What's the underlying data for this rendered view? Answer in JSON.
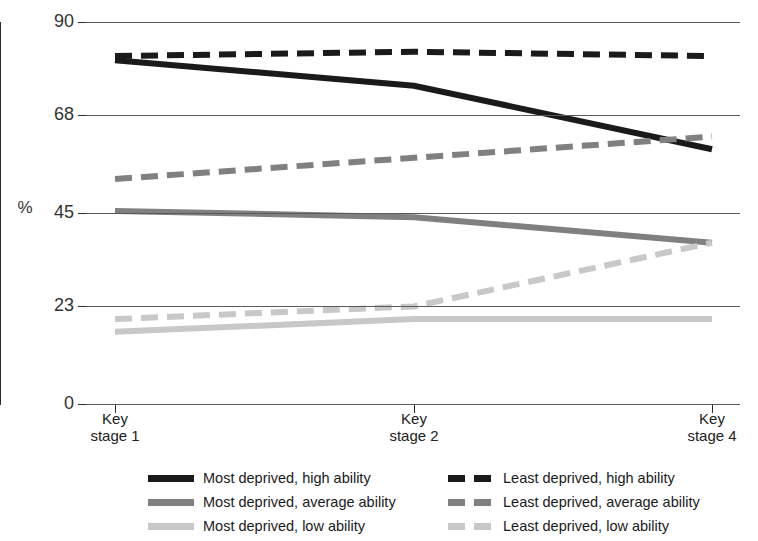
{
  "chart_data": {
    "type": "line",
    "title": "",
    "xlabel": "",
    "ylabel": "%",
    "categories": [
      "Key\nstage 1",
      "Key\nstage 2",
      "Key\nstage 4"
    ],
    "category_labels": [
      {
        "line1": "Key",
        "line2": "stage 1"
      },
      {
        "line1": "Key",
        "line2": "stage 2"
      },
      {
        "line1": "Key",
        "line2": "stage 4"
      }
    ],
    "yticks": [
      0,
      23,
      45,
      68,
      90
    ],
    "ylim": [
      0,
      90
    ],
    "grid": true,
    "legend_position": "bottom",
    "series": [
      {
        "name": "Most deprived, high ability",
        "values": [
          81,
          75,
          60
        ],
        "color": "#1a1a1a",
        "style": "solid"
      },
      {
        "name": "Most deprived, average ability",
        "values": [
          45.5,
          44,
          38
        ],
        "color": "#808080",
        "style": "solid"
      },
      {
        "name": "Most deprived, low ability",
        "values": [
          17,
          20,
          20
        ],
        "color": "#c8c8c8",
        "style": "solid"
      },
      {
        "name": "Least deprived, high ability",
        "values": [
          82,
          83,
          82
        ],
        "color": "#1a1a1a",
        "style": "dashed"
      },
      {
        "name": "Least deprived, average ability",
        "values": [
          53,
          58,
          63
        ],
        "color": "#808080",
        "style": "dashed"
      },
      {
        "name": "Least deprived, low ability",
        "values": [
          20,
          23,
          38
        ],
        "color": "#c8c8c8",
        "style": "dashed"
      }
    ]
  },
  "legend": {
    "left_column": [
      {
        "label": "Most deprived, high ability",
        "color": "#1a1a1a",
        "style": "solid"
      },
      {
        "label": "Most deprived, average ability",
        "color": "#808080",
        "style": "solid"
      },
      {
        "label": "Most deprived, low ability",
        "color": "#c8c8c8",
        "style": "solid"
      }
    ],
    "right_column": [
      {
        "label": "Least deprived, high ability",
        "color": "#1a1a1a",
        "style": "dashed"
      },
      {
        "label": "Least deprived, average ability",
        "color": "#808080",
        "style": "dashed"
      },
      {
        "label": "Least deprived, low ability",
        "color": "#c8c8c8",
        "style": "dashed"
      }
    ]
  },
  "axis": {
    "y_label_text": "%",
    "tick_labels_y": [
      "90",
      "68",
      "45",
      "23",
      "0"
    ]
  }
}
